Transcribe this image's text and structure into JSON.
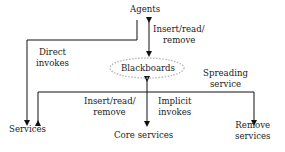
{
  "nodes": {
    "agents": "Agents",
    "blackboards": "Blackboards",
    "services": "Services",
    "core_services": "Core services",
    "remove_services_line1": "Remove",
    "remove_services_line2": "services"
  },
  "edges": {
    "agents_blackboards_line1": "Insert/read/",
    "agents_blackboards_line2": "remove",
    "direct_invokes_line1": "Direct",
    "direct_invokes_line2": "invokes",
    "spreading_service_line1": "Spreading",
    "spreading_service_line2": "service",
    "core_insert_line1": "Insert/read/",
    "core_insert_line2": "remove",
    "implicit_invokes_line1": "Implicit",
    "implicit_invokes_line2": "invokes"
  },
  "colors": {
    "line": "#111111",
    "text": "#222222",
    "cloud": "#bbbbbb"
  }
}
